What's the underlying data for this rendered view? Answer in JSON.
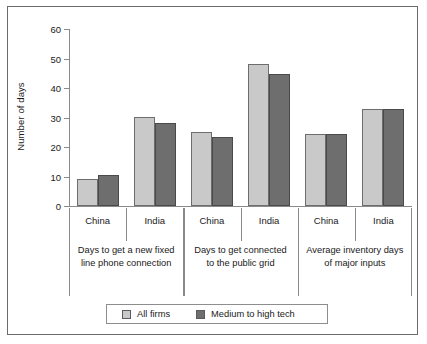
{
  "chart_data": {
    "type": "bar",
    "title": "",
    "xlabel": "",
    "ylabel": "Number of days",
    "ylim": [
      0,
      60
    ],
    "yticks": [
      0,
      10,
      20,
      30,
      40,
      50,
      60
    ],
    "grid": false,
    "legend_position": "bottom",
    "categories": [
      "China",
      "India",
      "China",
      "India",
      "China",
      "India"
    ],
    "groups": [
      {
        "title_line1": "Days to get a new fixed",
        "title_line2": "line phone connection",
        "countries": [
          "China",
          "India"
        ]
      },
      {
        "title_line1": "Days to get connected",
        "title_line2": "to the public grid",
        "countries": [
          "China",
          "India"
        ]
      },
      {
        "title_line1": "Average inventory days",
        "title_line2": "of major inputs",
        "countries": [
          "China",
          "India"
        ]
      }
    ],
    "series": [
      {
        "name": "All firms",
        "color": "#c9c9c9",
        "values": [
          9.3,
          30.2,
          25.2,
          48.0,
          24.5,
          32.8
        ]
      },
      {
        "name": "Medium to high tech",
        "color": "#6e6e6e",
        "values": [
          10.5,
          28.1,
          23.5,
          44.6,
          24.5,
          32.8
        ]
      }
    ],
    "legend": [
      {
        "label": "All firms",
        "swatch": "light"
      },
      {
        "label": "Medium to high tech",
        "swatch": "dark"
      }
    ]
  }
}
